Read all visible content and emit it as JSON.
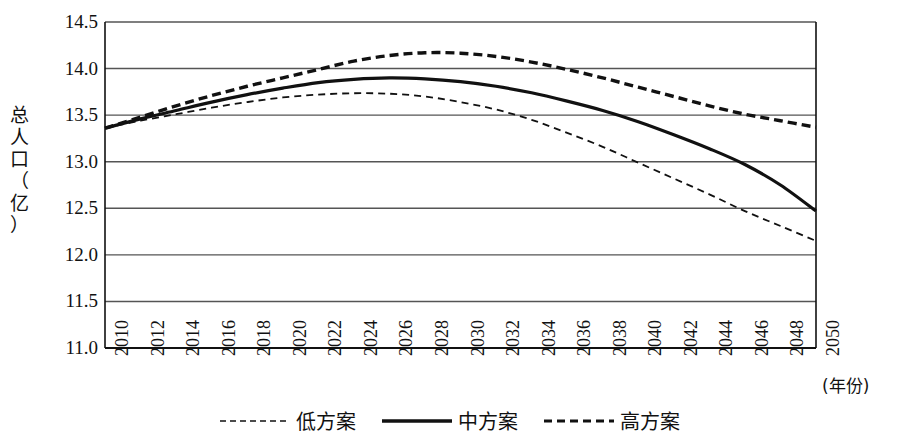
{
  "chart_data": {
    "type": "line",
    "title": "",
    "xlabel": "(年份)",
    "ylabel": "总人口（亿）",
    "ylabel_chars": [
      "总",
      "人",
      "口",
      "（",
      "亿",
      "）"
    ],
    "ylim": [
      11.0,
      14.5
    ],
    "yticks": [
      "14.5",
      "14.0",
      "13.5",
      "13.0",
      "12.5",
      "12.0",
      "11.5",
      "11.0"
    ],
    "ytick_values": [
      14.5,
      14.0,
      13.5,
      13.0,
      12.5,
      12.0,
      11.5,
      11.0
    ],
    "grid": true,
    "legend_position": "bottom",
    "xlim": [
      2010,
      2050
    ],
    "x": [
      2010,
      2012,
      2014,
      2016,
      2018,
      2020,
      2022,
      2024,
      2026,
      2028,
      2030,
      2032,
      2034,
      2036,
      2038,
      2040,
      2042,
      2044,
      2046,
      2048,
      2050
    ],
    "categories": [
      "2010",
      "2012",
      "2014",
      "2016",
      "2018",
      "2020",
      "2022",
      "2024",
      "2026",
      "2028",
      "2030",
      "2032",
      "2034",
      "2036",
      "2038",
      "2040",
      "2042",
      "2044",
      "2046",
      "2048",
      "2050"
    ],
    "series": [
      {
        "name": "低方案",
        "style": "fine-dashed",
        "values": [
          13.36,
          13.44,
          13.51,
          13.58,
          13.64,
          13.69,
          13.72,
          13.735,
          13.73,
          13.7,
          13.64,
          13.56,
          13.45,
          13.31,
          13.16,
          12.99,
          12.82,
          12.65,
          12.47,
          12.31,
          12.15
        ]
      },
      {
        "name": "中方案",
        "style": "solid",
        "values": [
          13.36,
          13.46,
          13.55,
          13.64,
          13.72,
          13.79,
          13.85,
          13.885,
          13.9,
          13.89,
          13.86,
          13.81,
          13.74,
          13.65,
          13.55,
          13.43,
          13.29,
          13.14,
          12.97,
          12.75,
          12.47
        ]
      },
      {
        "name": "高方案",
        "style": "bold-dashed",
        "values": [
          13.36,
          13.48,
          13.6,
          13.71,
          13.81,
          13.9,
          13.99,
          14.08,
          14.14,
          14.17,
          14.165,
          14.13,
          14.07,
          13.99,
          13.9,
          13.8,
          13.7,
          13.6,
          13.51,
          13.44,
          13.37
        ]
      }
    ]
  },
  "legend": {
    "items": [
      {
        "label": "低方案",
        "style": "fine-dashed"
      },
      {
        "label": "中方案",
        "style": "solid"
      },
      {
        "label": "高方案",
        "style": "bold-dashed"
      }
    ]
  },
  "colors": {
    "line": "#111111",
    "grid": "#555555",
    "background": "#ffffff"
  }
}
